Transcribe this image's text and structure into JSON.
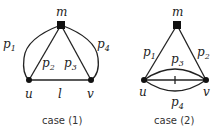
{
  "diagrams": [
    {
      "caption": "case (1)",
      "nodes": {
        "m": "m",
        "u": "u",
        "v": "v"
      },
      "edges": {
        "p1": "1",
        "p2": "2",
        "p3": "3",
        "p4": "4",
        "l": "l"
      }
    },
    {
      "caption": "case (2)",
      "nodes": {
        "m": "m",
        "u": "u",
        "v": "v"
      },
      "edges": {
        "p1": "1",
        "p2": "2",
        "p3": "3",
        "p4": "4"
      }
    }
  ],
  "colors": {
    "stroke": "#222222",
    "background": "#ffffff"
  }
}
